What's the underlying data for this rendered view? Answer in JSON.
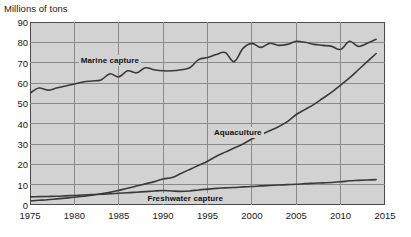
{
  "chart_data": {
    "type": "line",
    "title": "",
    "ylabel": "Millions of tons",
    "xlabel": "",
    "xlim": [
      1975,
      2015
    ],
    "ylim": [
      0,
      90
    ],
    "grid": true,
    "legend_position": "inline-labels",
    "yticks": [
      0,
      10,
      20,
      30,
      40,
      50,
      60,
      70,
      80,
      90
    ],
    "xticks": [
      1975,
      1980,
      1985,
      1990,
      1995,
      2000,
      2005,
      2010,
      2015
    ],
    "x": [
      1975,
      1976,
      1977,
      1978,
      1979,
      1980,
      1981,
      1982,
      1983,
      1984,
      1985,
      1986,
      1987,
      1988,
      1989,
      1990,
      1991,
      1992,
      1993,
      1994,
      1995,
      1996,
      1997,
      1998,
      1999,
      2000,
      2001,
      2002,
      2003,
      2004,
      2005,
      2006,
      2007,
      2008,
      2009,
      2010,
      2011,
      2012,
      2013,
      2014
    ],
    "series": [
      {
        "name": "Marine capture",
        "color": "#3a3a3a",
        "values": [
          55.0,
          57.5,
          56.5,
          57.5,
          58.5,
          59.5,
          60.5,
          61.0,
          61.5,
          64.5,
          63.0,
          66.0,
          65.0,
          67.5,
          66.5,
          66.0,
          66.0,
          66.5,
          67.5,
          71.5,
          72.5,
          74.0,
          75.0,
          70.5,
          77.0,
          79.5,
          77.5,
          79.5,
          78.5,
          79.0,
          80.5,
          80.0,
          79.0,
          78.5,
          78.0,
          76.5,
          80.5,
          78.0,
          79.5,
          81.5
        ]
      },
      {
        "name": "Aquaculture",
        "color": "#3a3a3a",
        "values": [
          2.0,
          2.3,
          2.6,
          3.0,
          3.4,
          3.8,
          4.3,
          4.8,
          5.5,
          6.2,
          7.2,
          8.2,
          9.3,
          10.4,
          11.5,
          12.8,
          13.5,
          15.5,
          17.5,
          19.5,
          21.5,
          24.0,
          26.0,
          28.0,
          30.0,
          32.5,
          34.5,
          36.5,
          38.5,
          41.0,
          44.5,
          47.0,
          49.5,
          52.5,
          55.5,
          59.0,
          62.5,
          66.5,
          70.5,
          74.5
        ]
      },
      {
        "name": "Freshwater capture",
        "color": "#3a3a3a",
        "values": [
          4.0,
          4.1,
          4.2,
          4.3,
          4.5,
          4.7,
          4.9,
          5.1,
          5.3,
          5.5,
          5.8,
          6.0,
          6.3,
          6.6,
          6.9,
          7.1,
          6.9,
          6.7,
          6.9,
          7.4,
          7.8,
          8.2,
          8.4,
          8.6,
          8.9,
          9.1,
          9.4,
          9.6,
          9.8,
          10.0,
          10.2,
          10.5,
          10.7,
          10.9,
          11.1,
          11.4,
          11.9,
          12.1,
          12.3,
          12.5
        ]
      }
    ],
    "annotations": [
      {
        "text": "Marine capture",
        "x": 1980.5,
        "y": 71.5
      },
      {
        "text": "Aquaculture",
        "x": 1995.5,
        "y": 36.0
      },
      {
        "text": "Freshwater capture",
        "x": 1988.0,
        "y": 3.5
      }
    ]
  },
  "colors": {
    "plot_background": "#d2d2d2",
    "gridline": "#8a8a8a",
    "axis_border": "#4a4a4a",
    "line": "#3a3a3a",
    "text": "#1a1a1a"
  }
}
